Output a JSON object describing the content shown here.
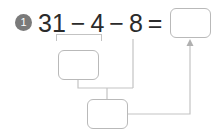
{
  "problem": {
    "number": "1",
    "equation": {
      "operand_1": "31",
      "operator_1": "−",
      "operand_2": "4",
      "operator_2": "−",
      "operand_3": "8",
      "equals": "=",
      "answer_value": ""
    },
    "work_steps": [
      {
        "label": "step-1-value",
        "value": ""
      },
      {
        "label": "step-2-value",
        "value": ""
      }
    ],
    "colors": {
      "badge_fill": "#7a7a7a",
      "badge_text": "#ffffff",
      "equation_text": "#2b2b2b",
      "box_border": "#b9b9b9",
      "connector": "#c3c3c3",
      "page_background": "#ffffff"
    }
  }
}
